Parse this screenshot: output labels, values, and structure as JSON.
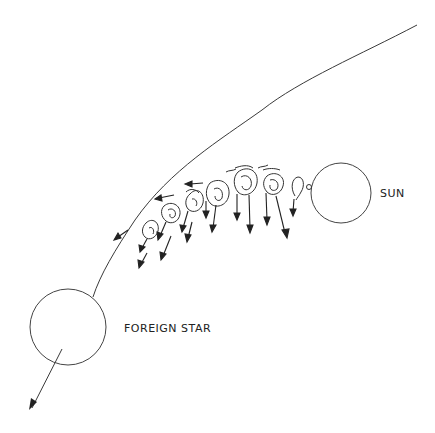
{
  "diagram": {
    "type": "astronomy-illustration",
    "labels": {
      "sun": "SUN",
      "foreign_star": "FOREIGN STAR"
    },
    "bodies": [
      {
        "name": "sun",
        "cx": 341,
        "cy": 193,
        "r": 30
      },
      {
        "name": "foreign-star",
        "cx": 67,
        "cy": 327,
        "r": 36
      }
    ],
    "trajectory": {
      "description": "Curved path of foreign star passing the Sun, from upper right to lower left",
      "direction": "down-left"
    },
    "filament": {
      "description": "Chain of swirling condensations drawn out from the Sun toward the foreign star's path, each with an arrow showing motion",
      "condensation_count": 7
    },
    "colors": {
      "ink": "#333333",
      "background": "#ffffff"
    }
  }
}
